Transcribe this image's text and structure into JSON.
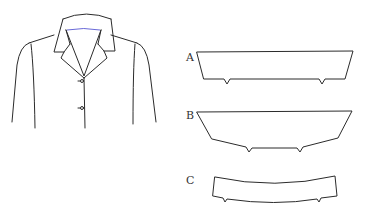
{
  "figure": {
    "jacket": {
      "description": "jacket with notched collar, two buttons"
    },
    "pieces": [
      {
        "id": "A",
        "label": "A"
      },
      {
        "id": "B",
        "label": "B"
      },
      {
        "id": "C",
        "label": "C"
      }
    ]
  },
  "colors": {
    "line": "#2b2b2b",
    "neckline_accent": "#6a6ad8",
    "background": "#ffffff"
  }
}
